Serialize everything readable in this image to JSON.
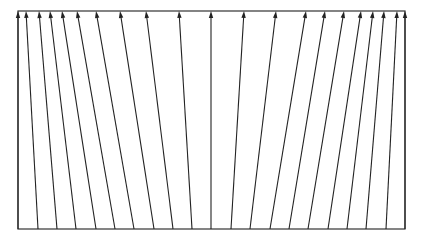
{
  "diagram": {
    "type": "arrow-fan",
    "frame": {
      "left": 18,
      "top": 11,
      "right": 405,
      "bottom": 229
    },
    "colors": {
      "stroke": "#222222",
      "frame": "#333333",
      "background": "#ffffff"
    },
    "arrows": [
      {
        "x_bottom": 18,
        "x_top": 18
      },
      {
        "x_bottom": 38,
        "x_top": 26
      },
      {
        "x_bottom": 57,
        "x_top": 39
      },
      {
        "x_bottom": 76,
        "x_top": 50
      },
      {
        "x_bottom": 96,
        "x_top": 62
      },
      {
        "x_bottom": 115,
        "x_top": 77
      },
      {
        "x_bottom": 134,
        "x_top": 96
      },
      {
        "x_bottom": 154,
        "x_top": 120
      },
      {
        "x_bottom": 173,
        "x_top": 146
      },
      {
        "x_bottom": 192,
        "x_top": 179
      },
      {
        "x_bottom": 211,
        "x_top": 211
      },
      {
        "x_bottom": 231,
        "x_top": 244
      },
      {
        "x_bottom": 250,
        "x_top": 276
      },
      {
        "x_bottom": 270,
        "x_top": 306
      },
      {
        "x_bottom": 289,
        "x_top": 325
      },
      {
        "x_bottom": 308,
        "x_top": 344
      },
      {
        "x_bottom": 328,
        "x_top": 361
      },
      {
        "x_bottom": 347,
        "x_top": 373
      },
      {
        "x_bottom": 366,
        "x_top": 384
      },
      {
        "x_bottom": 386,
        "x_top": 397
      },
      {
        "x_bottom": 405,
        "x_top": 405
      }
    ]
  }
}
